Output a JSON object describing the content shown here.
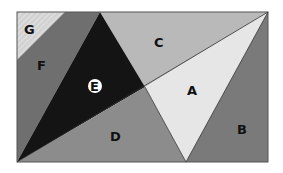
{
  "diagram": {
    "title": "",
    "regions": [
      {
        "id": "A",
        "label": "A",
        "color": "#e6e6e6"
      },
      {
        "id": "B",
        "label": "B",
        "color": "#7a7a7a"
      },
      {
        "id": "C",
        "label": "C",
        "color": "#b9b9b9"
      },
      {
        "id": "D",
        "label": "D",
        "color": "#8c8c8c"
      },
      {
        "id": "E",
        "label": "E",
        "color": "#141414"
      },
      {
        "id": "F",
        "label": "F",
        "color": "#6f6f6f"
      },
      {
        "id": "G",
        "label": "G",
        "color": "#d2d2d2"
      }
    ]
  }
}
